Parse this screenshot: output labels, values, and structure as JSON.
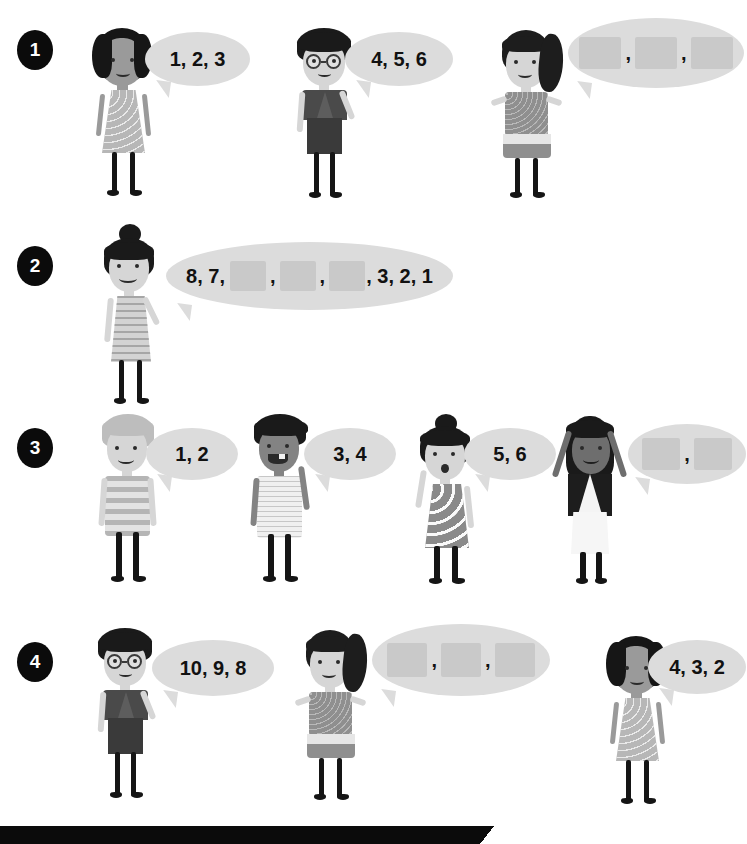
{
  "worksheet": {
    "title": "Counting sequences speech bubble worksheet",
    "bubble_color": "#dcdcdc",
    "blank_color": "#c9c9c9",
    "badge_color": "#0b0b0b"
  },
  "rows": [
    {
      "number": "1",
      "bubbles": [
        {
          "id": "r1b1",
          "text": "1, 2, 3",
          "blanks": 0
        },
        {
          "id": "r1b2",
          "text": "4, 5, 6",
          "blanks": 0
        },
        {
          "id": "r1b3",
          "text": "",
          "blanks": 3,
          "separators": [
            ",",
            ","
          ]
        }
      ],
      "characters": [
        {
          "name": "girl-bob-speckled-dress"
        },
        {
          "name": "boy-glasses-dark-shirt"
        },
        {
          "name": "girl-ponytail-shrugging"
        }
      ]
    },
    {
      "number": "2",
      "bubbles": [
        {
          "id": "r2b1",
          "text_before": "8, 7,",
          "text_after": ", 3, 2, 1",
          "blanks": 3,
          "separators": [
            ",",
            ","
          ]
        }
      ],
      "characters": [
        {
          "name": "girl-bun-wavy-dress"
        }
      ]
    },
    {
      "number": "3",
      "bubbles": [
        {
          "id": "r3b1",
          "text": "1, 2",
          "blanks": 0
        },
        {
          "id": "r3b2",
          "text": "3, 4",
          "blanks": 0
        },
        {
          "id": "r3b3",
          "text": "5, 6",
          "blanks": 0
        },
        {
          "id": "r3b4",
          "text": "",
          "blanks": 2,
          "separators": [
            ","
          ]
        }
      ],
      "characters": [
        {
          "name": "boy-striped-shirt"
        },
        {
          "name": "boy-pointing-white-shirt"
        },
        {
          "name": "girl-polkadot-dress"
        },
        {
          "name": "girl-arms-up-pinafore"
        }
      ]
    },
    {
      "number": "4",
      "bubbles": [
        {
          "id": "r4b1",
          "text": "10, 9, 8",
          "blanks": 0
        },
        {
          "id": "r4b2",
          "text": "",
          "blanks": 3,
          "separators": [
            ",",
            ","
          ]
        },
        {
          "id": "r4b3",
          "text": "4, 3, 2",
          "blanks": 0
        }
      ],
      "characters": [
        {
          "name": "boy-glasses-dark-shirt"
        },
        {
          "name": "girl-ponytail-shrugging"
        },
        {
          "name": "girl-bob-speckled-dress"
        }
      ]
    }
  ],
  "footer": {
    "bar_width_px": "480"
  }
}
